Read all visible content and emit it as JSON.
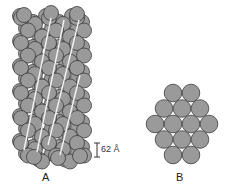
{
  "figure": {
    "panel_a": {
      "label": "A",
      "description": "side view of helical filament of spherical subunits",
      "scale_bar": {
        "text": "62 Å",
        "length_px": 14
      }
    },
    "panel_b": {
      "label": "B",
      "description": "end-on cross section showing hexagonal packing",
      "rows": [
        2,
        3,
        4,
        3,
        2
      ]
    },
    "colors": {
      "sphere_fill": "#9a9a9a",
      "sphere_stroke": "#3c3c3c",
      "helix_line": "#f4f4f4",
      "background": "#ffffff"
    }
  }
}
